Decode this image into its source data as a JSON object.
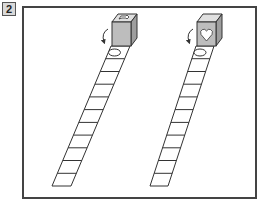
{
  "problem": {
    "number": "2"
  },
  "figures": [
    {
      "id": "left",
      "cube_top_symbol": "arrow-shape",
      "cube_front_symbol": "blank",
      "strip_first_cell_symbol": "ellipse",
      "strip_cells": 11,
      "rotation_arrow": "curved-down"
    },
    {
      "id": "right",
      "cube_top_symbol": "blank",
      "cube_front_symbol": "heart",
      "strip_first_cell_symbol": "ellipse",
      "strip_cells": 11,
      "rotation_arrow": "curved-down"
    }
  ],
  "colors": {
    "frame": "#444444",
    "cube_face": "#bdbdbd",
    "cube_top": "#e0e0e0",
    "line": "#333333"
  }
}
